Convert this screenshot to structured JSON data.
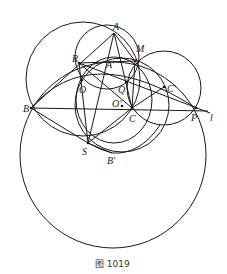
{
  "figure": {
    "caption": "图 1019",
    "points": {
      "A": {
        "label": "A",
        "x": 114,
        "y": 33
      },
      "M": {
        "label": "M",
        "x": 135,
        "y": 61
      },
      "R": {
        "label": "R",
        "x": 79,
        "y": 63
      },
      "A_prime": {
        "label": "A'",
        "x": 110,
        "y": 63
      },
      "O": {
        "label": "O",
        "x": 82,
        "y": 80
      },
      "Q": {
        "label": "Q",
        "x": 126,
        "y": 82
      },
      "O_prime": {
        "label": "O'",
        "x": 122,
        "y": 107
      },
      "C": {
        "label": "C",
        "x": 132,
        "y": 108
      },
      "C_prime": {
        "label": "C'",
        "x": 164,
        "y": 87
      },
      "B": {
        "label": "B",
        "x": 31,
        "y": 108
      },
      "P": {
        "label": "P",
        "x": 196,
        "y": 108
      },
      "l": {
        "label": "l"
      },
      "S": {
        "label": "S",
        "x": 88,
        "y": 143
      },
      "B_prime": {
        "label": "B'",
        "x": 112,
        "y": 153
      }
    }
  }
}
